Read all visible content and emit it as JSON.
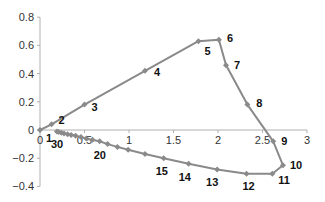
{
  "chart_data": {
    "type": "scatter",
    "title": "",
    "xlabel": "",
    "ylabel": "",
    "xlim": [
      0,
      3
    ],
    "ylim": [
      -0.4,
      0.8
    ],
    "grid": false,
    "legend": null,
    "x_ticks": [
      "0",
      "0.5",
      "1",
      "1.5",
      "2",
      "2.5",
      "3"
    ],
    "y_ticks": [
      "0.8",
      "0.6",
      "0.4",
      "0.2",
      "0",
      "-0.2",
      "-0.4"
    ],
    "series": [
      {
        "name": "trajectory",
        "line": true,
        "marker": "diamond",
        "color": "#8a8a8a",
        "points": [
          {
            "n": 1,
            "x": 0.0,
            "y": 0.0
          },
          {
            "n": 2,
            "x": 0.13,
            "y": 0.04
          },
          {
            "n": 3,
            "x": 0.5,
            "y": 0.18
          },
          {
            "n": 4,
            "x": 1.18,
            "y": 0.42
          },
          {
            "n": 5,
            "x": 1.78,
            "y": 0.63
          },
          {
            "n": 6,
            "x": 2.01,
            "y": 0.64
          },
          {
            "n": 7,
            "x": 2.09,
            "y": 0.46
          },
          {
            "n": 8,
            "x": 2.33,
            "y": 0.18
          },
          {
            "n": 9,
            "x": 2.62,
            "y": -0.08
          },
          {
            "n": 10,
            "x": 2.73,
            "y": -0.25
          },
          {
            "n": 11,
            "x": 2.61,
            "y": -0.31
          },
          {
            "n": 12,
            "x": 2.32,
            "y": -0.31
          },
          {
            "n": 13,
            "x": 1.99,
            "y": -0.28
          },
          {
            "n": 14,
            "x": 1.67,
            "y": -0.24
          },
          {
            "n": 15,
            "x": 1.39,
            "y": -0.2
          },
          {
            "n": 16,
            "x": 1.18,
            "y": -0.17
          },
          {
            "n": 17,
            "x": 0.99,
            "y": -0.14
          },
          {
            "n": 18,
            "x": 0.87,
            "y": -0.12
          },
          {
            "n": 19,
            "x": 0.76,
            "y": -0.1
          },
          {
            "n": 20,
            "x": 0.67,
            "y": -0.08
          },
          {
            "n": 21,
            "x": 0.59,
            "y": -0.07
          },
          {
            "n": 22,
            "x": 0.52,
            "y": -0.06
          },
          {
            "n": 23,
            "x": 0.46,
            "y": -0.05
          },
          {
            "n": 24,
            "x": 0.4,
            "y": -0.04
          },
          {
            "n": 25,
            "x": 0.35,
            "y": -0.035
          },
          {
            "n": 26,
            "x": 0.31,
            "y": -0.03
          },
          {
            "n": 27,
            "x": 0.27,
            "y": -0.025
          },
          {
            "n": 28,
            "x": 0.24,
            "y": -0.02
          },
          {
            "n": 29,
            "x": 0.21,
            "y": -0.015
          },
          {
            "n": 30,
            "x": 0.19,
            "y": -0.01
          }
        ]
      }
    ],
    "point_labels": [
      {
        "text": "1",
        "x": 0.0,
        "y": 0.0,
        "dx": 6,
        "dy": 12
      },
      {
        "text": "2",
        "x": 0.13,
        "y": 0.04,
        "dx": 7,
        "dy": 0
      },
      {
        "text": "3",
        "x": 0.5,
        "y": 0.18,
        "dx": 7,
        "dy": 6
      },
      {
        "text": "4",
        "x": 1.18,
        "y": 0.42,
        "dx": 9,
        "dy": 5
      },
      {
        "text": "5",
        "x": 1.78,
        "y": 0.63,
        "dx": 6,
        "dy": 14
      },
      {
        "text": "6",
        "x": 2.01,
        "y": 0.64,
        "dx": 8,
        "dy": 2
      },
      {
        "text": "7",
        "x": 2.09,
        "y": 0.46,
        "dx": 8,
        "dy": 4
      },
      {
        "text": "8",
        "x": 2.33,
        "y": 0.18,
        "dx": 9,
        "dy": 2
      },
      {
        "text": "9",
        "x": 2.62,
        "y": -0.08,
        "dx": 8,
        "dy": 4
      },
      {
        "text": "10",
        "x": 2.73,
        "y": -0.25,
        "dx": 7,
        "dy": 4
      },
      {
        "text": "11",
        "x": 2.61,
        "y": -0.31,
        "dx": 6,
        "dy": 10
      },
      {
        "text": "12",
        "x": 2.32,
        "y": -0.31,
        "dx": -4,
        "dy": 16
      },
      {
        "text": "13",
        "x": 1.99,
        "y": -0.28,
        "dx": -11,
        "dy": 17
      },
      {
        "text": "14",
        "x": 1.67,
        "y": -0.24,
        "dx": -10,
        "dy": 17
      },
      {
        "text": "15",
        "x": 1.39,
        "y": -0.2,
        "dx": -8,
        "dy": 17
      },
      {
        "text": "20",
        "x": 0.67,
        "y": -0.08,
        "dx": -6,
        "dy": 18
      },
      {
        "text": "30",
        "x": 0.19,
        "y": -0.01,
        "dx": -6,
        "dy": 17
      }
    ]
  }
}
